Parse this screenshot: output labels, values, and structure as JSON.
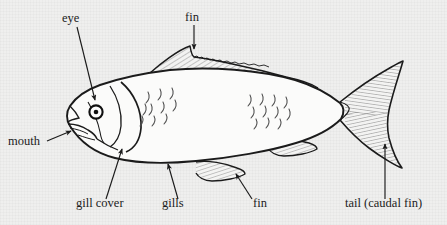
{
  "diagram": {
    "background_color": "#efefee",
    "ink_color": "#1b1b1b",
    "fin_shading_color": "#777777",
    "labels": [
      {
        "id": "eye",
        "text": "eye",
        "x": 62,
        "y": 22,
        "anchor": "start"
      },
      {
        "id": "fin-dorsal",
        "text": "fin",
        "x": 185,
        "y": 21,
        "anchor": "start"
      },
      {
        "id": "mouth",
        "text": "mouth",
        "x": 8,
        "y": 145,
        "anchor": "start"
      },
      {
        "id": "gill-cover",
        "text": "gill cover",
        "x": 76,
        "y": 207,
        "anchor": "start"
      },
      {
        "id": "gills",
        "text": "gills",
        "x": 162,
        "y": 207,
        "anchor": "start"
      },
      {
        "id": "fin-anal",
        "text": "fin",
        "x": 253,
        "y": 207,
        "anchor": "start"
      },
      {
        "id": "tail",
        "text": "tail (caudal fin)",
        "x": 345,
        "y": 207,
        "anchor": "start"
      }
    ],
    "leaders": [
      {
        "id": "eye-leader",
        "from": [
          77,
          27
        ],
        "to": [
          95,
          100
        ],
        "arrow": true
      },
      {
        "id": "fin-dorsal-leader",
        "from": [
          194,
          25
        ],
        "to": [
          194,
          49
        ],
        "arrow": true
      },
      {
        "id": "mouth-leader",
        "from": [
          47,
          140
        ],
        "to": [
          70,
          131
        ],
        "arrow": true
      },
      {
        "id": "gill-cover-leader",
        "from": [
          106,
          199
        ],
        "to": [
          122,
          149
        ],
        "arrow": true
      },
      {
        "id": "gills-leader",
        "from": [
          178,
          199
        ],
        "to": [
          168,
          164
        ],
        "arrow": true
      },
      {
        "id": "fin-anal-leader",
        "from": [
          252,
          199
        ],
        "to": [
          236,
          174
        ],
        "arrow": true
      },
      {
        "id": "tail-leader",
        "from": [
          385,
          199
        ],
        "to": [
          385,
          144
        ],
        "arrow": true
      }
    ],
    "parts": [
      {
        "id": "body",
        "name": "fish body outline"
      },
      {
        "id": "head",
        "name": "head and gill cover"
      },
      {
        "id": "eye",
        "name": "eye",
        "center": [
          96,
          112
        ],
        "outer_r": 6.5,
        "pupil_r": 2.2
      },
      {
        "id": "mouth",
        "name": "mouth"
      },
      {
        "id": "dorsal-fin",
        "name": "dorsal fin"
      },
      {
        "id": "pectoral-fin",
        "name": "pectoral fin"
      },
      {
        "id": "pelvic-fin",
        "name": "pelvic fin"
      },
      {
        "id": "anal-fin",
        "name": "anal fin"
      },
      {
        "id": "caudal-fin",
        "name": "caudal (tail) fin"
      },
      {
        "id": "scales",
        "name": "scale markings"
      }
    ]
  }
}
